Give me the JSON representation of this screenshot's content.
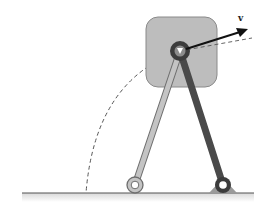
{
  "diagram": {
    "colors": {
      "block_fill": "#bdbdbd",
      "block_stroke": "#8a8a8a",
      "light_rod": "#b8b8b8",
      "light_rod_stroke": "#6e6e6e",
      "dark_rod": "#4a4a4a",
      "pivot_outer": "#3c3c3c",
      "pivot_inner": "#8c8c8c",
      "ground_line": "#555555",
      "dashed": "#555555",
      "arrow": "#111111"
    },
    "elements": {
      "block": {
        "x": 146,
        "y": 17,
        "width": 71,
        "height": 70,
        "corner_radius": 12
      },
      "pivot": {
        "cx": 180,
        "cy": 51,
        "r": 10
      },
      "light_rod": {
        "from": [
          180,
          51
        ],
        "to": [
          135,
          185
        ]
      },
      "dark_rod": {
        "from": [
          180,
          51
        ],
        "to": [
          223,
          185
        ]
      },
      "left_joint": {
        "cx": 135,
        "cy": 185,
        "r": 8
      },
      "right_joint": {
        "cx": 223,
        "cy": 185,
        "r": 8
      },
      "ground": {
        "x1": 22,
        "x2": 254,
        "y": 193
      },
      "arc_end_x": 86,
      "velocity_vector": {
        "from": [
          180,
          51
        ],
        "to": [
          247,
          30
        ]
      }
    },
    "labels": {
      "velocity": "v"
    }
  }
}
